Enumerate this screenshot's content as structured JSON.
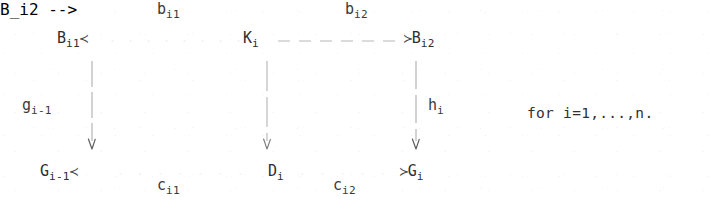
{
  "document": {
    "kind": "commutative-diagram",
    "ink_color": "#2e2e30",
    "paper_color": "#ffffff"
  },
  "nodes": {
    "top_left": {
      "base": "B",
      "sub": "i1",
      "arrowhead": "≺"
    },
    "top_mid": {
      "base": "K",
      "sub": "i",
      "arrowhead": ""
    },
    "top_right": {
      "base": "B",
      "sub": "i2",
      "arrowhead": "≻"
    },
    "bottom_left": {
      "base": "G",
      "sub": "i-1",
      "arrowhead": "≺"
    },
    "bottom_mid": {
      "base": "D",
      "sub": "i",
      "arrowhead": ""
    },
    "bottom_right": {
      "base": "G",
      "sub": "i",
      "arrowhead": "≻"
    }
  },
  "arrow_labels": {
    "top_left_arrow": {
      "base": "b",
      "sub": "i1"
    },
    "top_right_arrow": {
      "base": "b",
      "sub": "i2"
    },
    "bottom_left_arrow": {
      "base": "c",
      "sub": "i1"
    },
    "bottom_right_arrow": {
      "base": "c",
      "sub": "i2"
    },
    "vertical_left": {
      "base": "g",
      "sub": "i-1"
    },
    "vertical_middle": {
      "base": "",
      "sub": ""
    },
    "vertical_right": {
      "base": "h",
      "sub": "i"
    }
  },
  "annotation": {
    "quantifier": "for i=1,...,n."
  }
}
